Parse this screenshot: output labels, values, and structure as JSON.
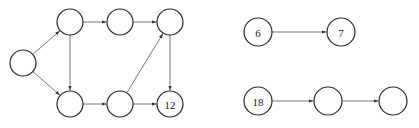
{
  "diagram": {
    "type": "directed-graph",
    "components": [
      {
        "id": "graph-left",
        "nodes": [
          {
            "id": "A",
            "label": "",
            "x": 23,
            "y": 63,
            "r": 13
          },
          {
            "id": "B",
            "label": "",
            "x": 70,
            "y": 22,
            "r": 13
          },
          {
            "id": "C",
            "label": "",
            "x": 120,
            "y": 22,
            "r": 13
          },
          {
            "id": "D",
            "label": "",
            "x": 170,
            "y": 22,
            "r": 13
          },
          {
            "id": "E",
            "label": "",
            "x": 70,
            "y": 104,
            "r": 13
          },
          {
            "id": "F",
            "label": "",
            "x": 120,
            "y": 104,
            "r": 13
          },
          {
            "id": "G",
            "label": "12",
            "x": 170,
            "y": 104,
            "r": 13
          }
        ],
        "edges": [
          {
            "from": "A",
            "to": "B"
          },
          {
            "from": "A",
            "to": "E"
          },
          {
            "from": "B",
            "to": "C"
          },
          {
            "from": "B",
            "to": "E"
          },
          {
            "from": "C",
            "to": "D"
          },
          {
            "from": "D",
            "to": "G"
          },
          {
            "from": "E",
            "to": "F"
          },
          {
            "from": "F",
            "to": "D"
          },
          {
            "from": "F",
            "to": "G"
          }
        ]
      },
      {
        "id": "graph-right-top",
        "nodes": [
          {
            "id": "H",
            "label": "6",
            "x": 258,
            "y": 32,
            "r": 14
          },
          {
            "id": "I",
            "label": "7",
            "x": 341,
            "y": 32,
            "r": 14
          }
        ],
        "edges": [
          {
            "from": "H",
            "to": "I"
          }
        ]
      },
      {
        "id": "graph-right-bottom",
        "nodes": [
          {
            "id": "J",
            "label": "18",
            "x": 258,
            "y": 101,
            "r": 14
          },
          {
            "id": "K",
            "label": "",
            "x": 328,
            "y": 101,
            "r": 14
          },
          {
            "id": "L",
            "label": "",
            "x": 393,
            "y": 101,
            "r": 14
          }
        ],
        "edges": [
          {
            "from": "J",
            "to": "K"
          },
          {
            "from": "K",
            "to": "L"
          }
        ]
      }
    ]
  }
}
